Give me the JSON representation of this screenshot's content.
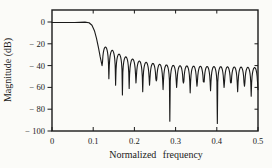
{
  "figure": {
    "background_color": "#fbfbf8",
    "ink_color": "#1a1a1a"
  },
  "y_axis": {
    "title": "Magnitude (dB)",
    "tick_values": [
      0,
      -20,
      -40,
      -60,
      -80,
      -100
    ],
    "tick_labels": [
      "0",
      "− 20",
      "− 40",
      "− 60",
      "− 80",
      "− 100"
    ],
    "right_tick_values": [
      -20,
      -40,
      -60,
      -80
    ]
  },
  "x_axis": {
    "title": "Normalized frequency",
    "tick_values": [
      0,
      0.1,
      0.2,
      0.3,
      0.4,
      0.5
    ],
    "tick_labels": [
      "0",
      "0.1",
      "0.2",
      "0.3",
      "0.4",
      "0.5"
    ],
    "top_tick_values": [
      0.1,
      0.2,
      0.3,
      0.4
    ]
  },
  "chart_data": {
    "type": "line",
    "title": "",
    "xlabel": "Normalized frequency",
    "ylabel": "Magnitude (dB)",
    "xlim": [
      0,
      0.5
    ],
    "ylim": [
      -100,
      10
    ],
    "x_ticks": [
      0,
      0.1,
      0.2,
      0.3,
      0.4,
      0.5
    ],
    "y_ticks": [
      0,
      -20,
      -40,
      -60,
      -80,
      -100
    ],
    "grid": false,
    "legend": false,
    "description_of_series": "Lowpass FIR filter magnitude response: flat 0 dB passband to ~0.1, sharp transition, oscillating stopband sidelobes near -40 dB with deep notches near 0.28 and 0.40",
    "passband_level_db": 0,
    "passband_edge_frequency": 0.1,
    "transition_points": [
      [
        0,
        -0.5
      ],
      [
        0.055,
        -0.5
      ],
      [
        0.08,
        -0.1
      ],
      [
        0.09,
        -0.7
      ],
      [
        0.097,
        -3
      ],
      [
        0.103,
        -8
      ],
      [
        0.108,
        -15
      ],
      [
        0.113,
        -24
      ],
      [
        0.117,
        -32
      ],
      [
        0.1215,
        -40
      ]
    ],
    "stopband": {
      "notches": [
        [
          0.1215,
          -40
        ],
        [
          0.138,
          -52
        ],
        [
          0.1544,
          -58
        ],
        [
          0.1709,
          -67
        ],
        [
          0.1873,
          -61
        ],
        [
          0.2038,
          -56
        ],
        [
          0.2202,
          -64
        ],
        [
          0.2367,
          -58
        ],
        [
          0.2531,
          -54
        ],
        [
          0.2696,
          -62
        ],
        [
          0.286,
          -91
        ],
        [
          0.3025,
          -60
        ],
        [
          0.319,
          -56
        ],
        [
          0.3354,
          -65
        ],
        [
          0.3519,
          -59
        ],
        [
          0.3683,
          -55
        ],
        [
          0.3848,
          -63
        ],
        [
          0.4013,
          -93
        ],
        [
          0.4177,
          -60
        ],
        [
          0.4342,
          -56
        ],
        [
          0.4506,
          -64
        ],
        [
          0.4671,
          -59
        ],
        [
          0.4835,
          -68
        ],
        [
          0.5,
          -62
        ]
      ],
      "sidelobe_peaks": [
        [
          0.1297,
          -23
        ],
        [
          0.1462,
          -26
        ],
        [
          0.1627,
          -29.5
        ],
        [
          0.1791,
          -32
        ],
        [
          0.1956,
          -34
        ],
        [
          0.212,
          -35.8
        ],
        [
          0.2285,
          -37
        ],
        [
          0.2449,
          -38
        ],
        [
          0.2614,
          -38.8
        ],
        [
          0.2778,
          -39.4
        ],
        [
          0.2943,
          -39.8
        ],
        [
          0.3107,
          -40.1
        ],
        [
          0.3272,
          -40.3
        ],
        [
          0.3436,
          -40.5
        ],
        [
          0.3601,
          -40.6
        ],
        [
          0.3765,
          -40.8
        ],
        [
          0.393,
          -40.9
        ],
        [
          0.4094,
          -41
        ],
        [
          0.4259,
          -41.1
        ],
        [
          0.4423,
          -41.3
        ],
        [
          0.4588,
          -41.4
        ],
        [
          0.4752,
          -41.6
        ],
        [
          0.4917,
          -41.8
        ]
      ]
    }
  },
  "plot_geometry": {
    "frame_left_px": 52,
    "frame_top_px": 10,
    "frame_right_px": 258,
    "frame_bottom_px": 131,
    "db_at_frame_zero_px": 22
  }
}
